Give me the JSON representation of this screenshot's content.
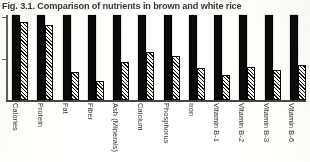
{
  "figure": {
    "caption": "Fig. 3.1. Comparison of nutrients in brown and white rice"
  },
  "axis": {
    "tick_top": "",
    "tick_mid": ""
  },
  "chart_data": {
    "type": "bar",
    "title": "Fig. 3.1. Comparison of nutrients in brown and white rice",
    "xlabel": "",
    "ylabel": "",
    "ylim": [
      0,
      100
    ],
    "grid": false,
    "legend_position": "none",
    "axis_tick_labels": [],
    "note": "Grouped bar chart; solid black bars represent brown rice (reference 100%), diagonally hatched bars represent white rice as a percentage of the brown-rice value. Values estimated from bar heights; no numeric axis labels are printed on the figure.",
    "categories": [
      "Calories",
      "Protein",
      "Fat",
      "Fiber",
      "Ash (Minerals)",
      "Calcium",
      "Phosphorus",
      "Iron",
      "Vitamin B-1",
      "Vitamin B-2",
      "Vitamin B-3",
      "Vitamin B-6"
    ],
    "series": [
      {
        "name": "Brown rice",
        "style": "solid-black",
        "values": [
          100,
          100,
          100,
          100,
          100,
          100,
          100,
          100,
          100,
          100,
          100,
          100
        ]
      },
      {
        "name": "White rice",
        "style": "diagonal-hatch",
        "values": [
          92,
          88,
          33,
          22,
          45,
          57,
          52,
          38,
          30,
          39,
          35,
          41
        ]
      }
    ]
  }
}
